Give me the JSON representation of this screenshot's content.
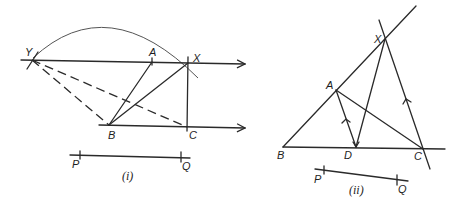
{
  "figure_i": {
    "caption": "(i)",
    "points": {
      "Y": "Y",
      "A": "A",
      "X": "X",
      "B": "B",
      "C": "C"
    },
    "segment": {
      "start": "P",
      "end": "Q"
    },
    "description": "Construction with parallel lines through A and B/C, arc centered near B from Y to X, dashed lines YB and YC, solid lines BA, BX, XC"
  },
  "figure_ii": {
    "caption": "(ii)",
    "points": {
      "A": "A",
      "B": "B",
      "C": "C",
      "D": "D",
      "X": "X"
    },
    "segment": {
      "start": "P",
      "end": "Q"
    },
    "description": "Triangle ABC with BA extended to X, XC parallel to AD (arrow marks), DX joined"
  },
  "colors": {
    "ink": "#2a2a2a",
    "background": "#ffffff"
  }
}
